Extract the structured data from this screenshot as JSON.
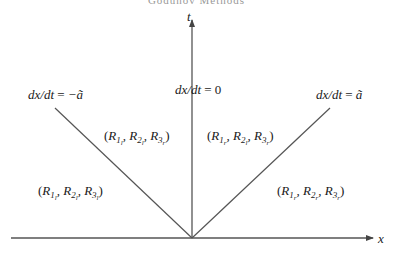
{
  "header": {
    "running_title": "Godunov Methods"
  },
  "axes": {
    "x_label": "x",
    "t_label": "t",
    "origin": [
      192,
      238
    ],
    "x_axis": {
      "from": [
        11,
        238
      ],
      "to": [
        373,
        238
      ]
    },
    "t_axis": {
      "from": [
        192,
        238
      ],
      "to": [
        192,
        20
      ]
    }
  },
  "characteristics": [
    {
      "name": "left-wave",
      "label": "dx/dt = −ã",
      "from": [
        192,
        238
      ],
      "to": [
        55,
        108
      ]
    },
    {
      "name": "contact",
      "label": "dx/dt = 0",
      "from": [
        192,
        238
      ],
      "to": [
        192,
        20
      ]
    },
    {
      "name": "right-wave",
      "label": "dx/dt = ã",
      "from": [
        192,
        238
      ],
      "to": [
        330,
        108
      ]
    }
  ],
  "regions": [
    {
      "name": "region-far-left",
      "text": "(R1l, R2l, R3l)",
      "subs": [
        "l",
        "l",
        "l"
      ]
    },
    {
      "name": "region-mid-left",
      "text": "(R1l, R2l, R3r)",
      "subs": [
        "l",
        "l",
        "r"
      ]
    },
    {
      "name": "region-mid-right",
      "text": "(R1r, R2l, R3r)",
      "subs": [
        "r",
        "l",
        "r"
      ]
    },
    {
      "name": "region-far-right",
      "text": "(R1r, R2r, R3r)",
      "subs": [
        "r",
        "r",
        "r"
      ]
    }
  ],
  "labels": {
    "left_wave": {
      "lhs": "dx/dt",
      "eq": " = ",
      "rhs": "−ã"
    },
    "contact": {
      "lhs": "dx/dt",
      "eq": " = ",
      "rhs": "0"
    },
    "right_wave": {
      "lhs": "dx/dt",
      "eq": " = ",
      "rhs": "ã"
    }
  },
  "colors": {
    "line": "#555555",
    "text": "#1a1a1a"
  }
}
